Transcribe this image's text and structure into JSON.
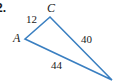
{
  "problem": {
    "number": "2."
  },
  "triangle": {
    "stroke_color": "#3a7fc1",
    "vertices": {
      "A": {
        "label": "A",
        "x": 25,
        "y": 39
      },
      "C": {
        "label": "C",
        "x": 50,
        "y": 17
      },
      "B": {
        "label": "",
        "x": 112,
        "y": 80
      }
    },
    "sides": {
      "AC": {
        "length": "12"
      },
      "CB": {
        "length": "40"
      },
      "AB": {
        "length": "44"
      }
    }
  }
}
